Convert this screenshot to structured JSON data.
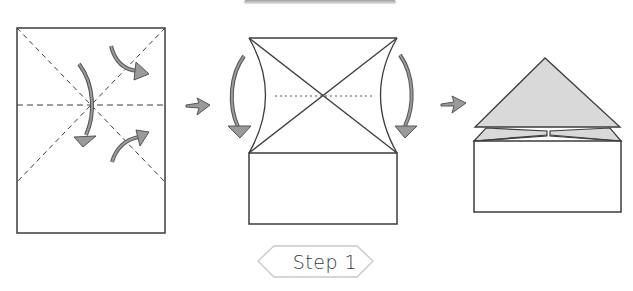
{
  "diagram": {
    "step_label": "Step 1",
    "colors": {
      "line": "#3c3c3c",
      "arrow_fill": "#9a9a9a",
      "arrow_stroke": "#555555",
      "shaded_paper": "#d9d9d9",
      "label_border": "#c8c8c8",
      "top_bar": "#bdbdbd"
    },
    "panels": [
      {
        "id": "panel-1",
        "description": "Rectangle sheet with dashed diagonal and horizontal crease lines; arrows indicate folding"
      },
      {
        "id": "panel-2",
        "description": "Top corners folded to create X crease; side curved arrows indicate folding sides in"
      },
      {
        "id": "panel-3",
        "description": "Resulting house shape with shaded triangle on top"
      }
    ],
    "transition_arrows": 2
  }
}
